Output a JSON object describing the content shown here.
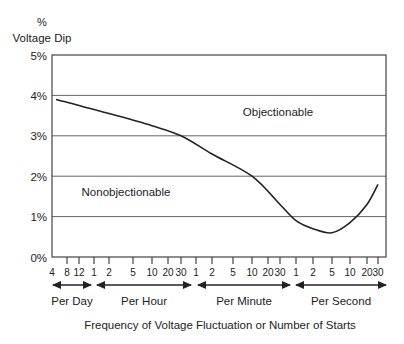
{
  "chart_data": {
    "type": "line",
    "title": "",
    "ylabel_top": "%",
    "ylabel": "Voltage Dip",
    "xlabel": "Frequency of Voltage Fluctuation or Number of Starts",
    "ylim": [
      0,
      5
    ],
    "y_ticks": [
      "0%",
      "1%",
      "2%",
      "3%",
      "4%",
      "5%"
    ],
    "grid": "horizontal",
    "x_scale": "logarithmic (time-unit groups)",
    "x_groups": [
      {
        "label": "Per Day",
        "ticks": [
          "4",
          "8",
          "12"
        ]
      },
      {
        "label": "Per Hour",
        "ticks": [
          "1",
          "2",
          "5",
          "10",
          "20",
          "30"
        ]
      },
      {
        "label": "Per Minute",
        "ticks": [
          "1",
          "2",
          "5",
          "10",
          "20",
          "30"
        ]
      },
      {
        "label": "Per Second",
        "ticks": [
          "1",
          "2",
          "5",
          "10",
          "20",
          "30"
        ]
      }
    ],
    "regions": [
      {
        "label": "Objectionable",
        "position": "above curve"
      },
      {
        "label": "Nonobjectionable",
        "position": "below curve"
      }
    ],
    "series": [
      {
        "name": "Threshold of objectionable voltage dip",
        "points": [
          {
            "x": "4 per day",
            "y": 3.9
          },
          {
            "x": "12 per day",
            "y": 3.75
          },
          {
            "x": "2 per hour",
            "y": 3.55
          },
          {
            "x": "10 per hour",
            "y": 3.25
          },
          {
            "x": "30 per hour",
            "y": 3.0
          },
          {
            "x": "2 per minute",
            "y": 2.55
          },
          {
            "x": "10 per minute",
            "y": 2.0
          },
          {
            "x": "30 per minute",
            "y": 1.3
          },
          {
            "x": "1 per second",
            "y": 0.9
          },
          {
            "x": "2 per second",
            "y": 0.7
          },
          {
            "x": "5 per second",
            "y": 0.6
          },
          {
            "x": "10 per second",
            "y": 0.85
          },
          {
            "x": "20 per second",
            "y": 1.3
          },
          {
            "x": "30 per second",
            "y": 1.8
          }
        ]
      }
    ]
  }
}
